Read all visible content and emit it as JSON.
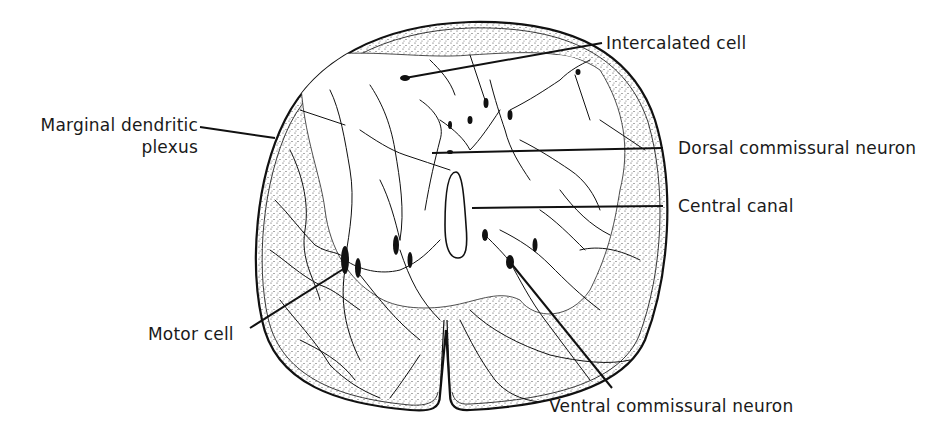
{
  "figure": {
    "colors": {
      "ink": "#111111",
      "background": "#ffffff",
      "stipple": "#555555"
    }
  },
  "labels": {
    "intercalated_cell": "Intercalated cell",
    "marginal_dendritic_line1": "Marginal dendritic",
    "marginal_dendritic_line2": "plexus",
    "dorsal_commissural_neuron": "Dorsal commissural neuron",
    "central_canal": "Central canal",
    "motor_cell": "Motor cell",
    "ventral_commissural_neuron": "Ventral commissural neuron"
  },
  "leader_lines": [
    {
      "name": "intercalated-cell-leader",
      "x1": 602,
      "y1": 43,
      "x2": 405,
      "y2": 78
    },
    {
      "name": "marginal-dendritic-leader",
      "x1": 200,
      "y1": 127,
      "x2": 275,
      "y2": 138
    },
    {
      "name": "dorsal-commissural-leader",
      "x1": 663,
      "y1": 148,
      "x2": 432,
      "y2": 153
    },
    {
      "name": "central-canal-leader",
      "x1": 663,
      "y1": 206,
      "x2": 472,
      "y2": 208
    },
    {
      "name": "motor-cell-leader",
      "x1": 250,
      "y1": 328,
      "x2": 345,
      "y2": 268
    },
    {
      "name": "ventral-commissural-leader",
      "x1": 612,
      "y1": 388,
      "x2": 510,
      "y2": 262
    }
  ]
}
